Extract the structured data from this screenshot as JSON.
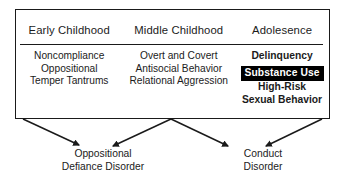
{
  "figure": {
    "columns": [
      {
        "header": "Early Childhood",
        "items": [
          {
            "text": "Noncompliance",
            "style": "plain"
          },
          {
            "text": "Oppositional",
            "style": "plain"
          },
          {
            "text": "Temper Tantrums",
            "style": "plain"
          }
        ]
      },
      {
        "header": "Middle Childhood",
        "items": [
          {
            "text": "Overt and Covert",
            "style": "plain"
          },
          {
            "text": "Antisocial Behavior",
            "style": "plain"
          },
          {
            "text": "Relational Aggression",
            "style": "plain"
          }
        ]
      },
      {
        "header": "Adolesence",
        "items": [
          {
            "text": "Delinquency",
            "style": "bold"
          },
          {
            "text": "Substance Use",
            "style": "highlight"
          },
          {
            "text": "High-Risk",
            "style": "bold"
          },
          {
            "text": "Sexual Behavior",
            "style": "bold"
          }
        ]
      }
    ],
    "outcomes": [
      {
        "line1": "Oppositional",
        "line2": "Defiance Disorder"
      },
      {
        "line1": "Conduct",
        "line2": "Disorder"
      }
    ],
    "arrows": [
      {
        "name": "arrow-early-to-odd",
        "from_x": 23,
        "from_y": 119,
        "to_x": 79,
        "to_y": 145
      },
      {
        "name": "arrow-middle-to-odd",
        "from_x": 171,
        "from_y": 119,
        "to_x": 113,
        "to_y": 146
      },
      {
        "name": "arrow-middle-to-cd",
        "from_x": 171,
        "from_y": 119,
        "to_x": 228,
        "to_y": 146
      },
      {
        "name": "arrow-adolescence-to-cd",
        "from_x": 322,
        "from_y": 119,
        "to_x": 266,
        "to_y": 146
      }
    ],
    "colors": {
      "line": "#1a1a1a",
      "text": "#1b1b1b",
      "highlight_background": "#000000",
      "highlight_text": "#ffffff",
      "background": "#ffffff"
    }
  }
}
